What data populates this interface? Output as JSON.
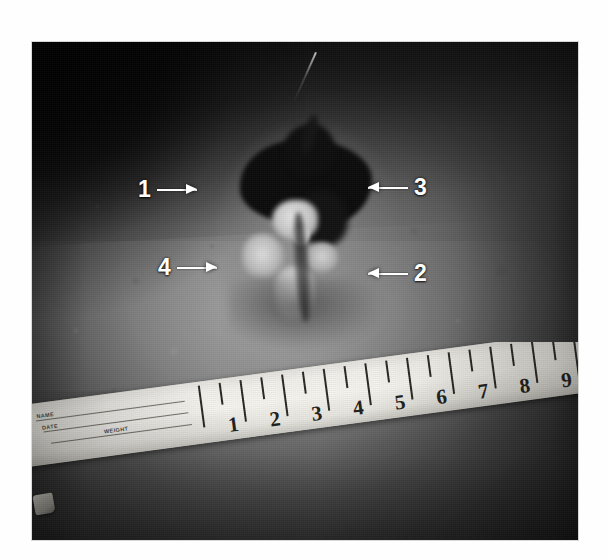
{
  "photograph": {
    "description": "Grayscale clinical photograph of an abdominal skin wound with necrotic eschar and granulation tissue, with a flexible paper measuring tape placed below for scale",
    "modality": "clinical-photograph",
    "color_mode": "grayscale",
    "background_color": "#ffffff",
    "frame": {
      "left": 32,
      "top": 42,
      "width": 546,
      "height": 498
    }
  },
  "annotations": {
    "arrow_color": "#ffffff",
    "items": [
      {
        "label": "1",
        "direction": "right",
        "x": 138,
        "y": 178,
        "target": "wound-margin-left"
      },
      {
        "label": "3",
        "direction": "left",
        "x": 368,
        "y": 176,
        "target": "necrotic-eschar"
      },
      {
        "label": "4",
        "direction": "right",
        "x": 158,
        "y": 256,
        "target": "granulation-tissue"
      },
      {
        "label": "2",
        "direction": "left",
        "x": 368,
        "y": 262,
        "target": "peri-wound-skin"
      }
    ]
  },
  "measuring_tape": {
    "type": "paper-measuring-tape",
    "unit": "in",
    "tape_color": "#f4f2ec",
    "mark_color": "#26251f",
    "numbers": [
      1,
      2,
      3,
      4,
      5,
      6,
      7,
      8,
      9
    ],
    "printed_fields": [
      "NAME",
      "DATE",
      "WEIGHT"
    ]
  }
}
